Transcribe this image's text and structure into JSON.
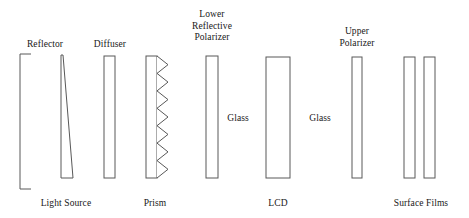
{
  "diagram": {
    "width": 469,
    "height": 218,
    "background_color": "#ffffff",
    "stroke_color": "#4a4a4a",
    "text_color": "#181818"
  },
  "labels": {
    "reflector": "Reflector",
    "light_source": "Light Source",
    "diffuser": "Diffuser",
    "prism": "Prism",
    "lower_reflective_polarizer_line1": "Lower",
    "lower_reflective_polarizer_line2": "Reflective",
    "lower_reflective_polarizer_line3": "Polarizer",
    "glass_left": "Glass",
    "lcd": "LCD",
    "glass_right": "Glass",
    "upper_polarizer_line1": "Upper",
    "upper_polarizer_line2": "Polarizer",
    "surface_films": "Surface Films"
  },
  "components": [
    {
      "id": "reflector",
      "name": "Reflector",
      "shape": "bracket",
      "label_position": "top",
      "label": "Reflector"
    },
    {
      "id": "light-source",
      "name": "Light Source",
      "shape": "wedge",
      "label_position": "bottom",
      "label": "Light Source"
    },
    {
      "id": "diffuser",
      "name": "Diffuser",
      "shape": "rectangle",
      "label_position": "top",
      "label": "Diffuser"
    },
    {
      "id": "prism",
      "name": "Prism",
      "shape": "sawtooth-rectangle",
      "teeth": 7,
      "label_position": "bottom",
      "label": "Prism"
    },
    {
      "id": "lower-reflective-polarizer",
      "name": "Lower Reflective Polarizer",
      "shape": "rectangle",
      "label_position": "top",
      "label": "Lower Reflective Polarizer"
    },
    {
      "id": "glass-left",
      "name": "Glass",
      "shape": "text-only",
      "label_position": "middle",
      "label": "Glass"
    },
    {
      "id": "lcd",
      "name": "LCD",
      "shape": "rectangle",
      "label_position": "bottom",
      "label": "LCD"
    },
    {
      "id": "glass-right",
      "name": "Glass",
      "shape": "text-only",
      "label_position": "middle",
      "label": "Glass"
    },
    {
      "id": "upper-polarizer",
      "name": "Upper Polarizer",
      "shape": "rectangle",
      "label_position": "top",
      "label": "Upper Polarizer"
    },
    {
      "id": "surface-films",
      "name": "Surface Films",
      "shape": "double-rectangle",
      "label_position": "bottom",
      "label": "Surface Films"
    }
  ]
}
